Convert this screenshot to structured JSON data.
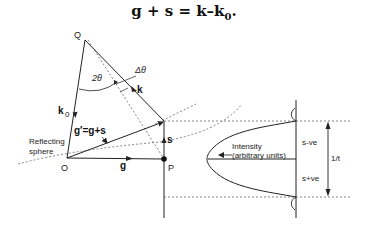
{
  "equation": {
    "lhs": "g + s = k–k",
    "sub": "0",
    "tail": "."
  },
  "points": {
    "Q": "Q",
    "O": "O",
    "P": "P"
  },
  "vectors": {
    "k0": "k",
    "k0_sub": "0",
    "k": "k",
    "g": "g",
    "s": "s",
    "g_prime": "g′=g+s"
  },
  "angles": {
    "two_theta": "2θ",
    "delta_theta": "Δθ"
  },
  "labels": {
    "reflecting_sphere_line1": "Reflecting",
    "reflecting_sphere_line2": "sphere",
    "intensity_line1": "Intensity",
    "intensity_line2": "(arbitrary units)",
    "s_negative": "s-ve",
    "s_positive": "s+ve",
    "thickness": "1/t"
  },
  "colors": {
    "line": "#222222",
    "dashed": "#666666",
    "background": "#ffffff"
  }
}
